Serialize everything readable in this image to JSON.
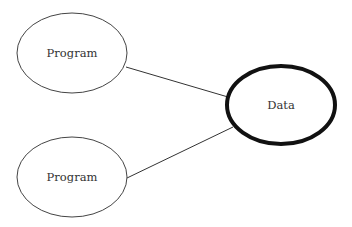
{
  "nodes": [
    {
      "id": "program-1",
      "label": "Program",
      "cx": 72,
      "cy": 53,
      "rx": 55,
      "ry": 40,
      "stroke": "#444444",
      "stroke_width": 1
    },
    {
      "id": "program-2",
      "label": "Program",
      "cx": 72,
      "cy": 177,
      "rx": 55,
      "ry": 40,
      "stroke": "#444444",
      "stroke_width": 1
    },
    {
      "id": "data",
      "label": "Data",
      "cx": 281,
      "cy": 105,
      "rx": 54,
      "ry": 39,
      "stroke": "#111111",
      "stroke_width": 4
    }
  ],
  "edges": [
    {
      "from": "program-1",
      "to": "data",
      "x1": 126,
      "y1": 67,
      "x2": 228,
      "y2": 97
    },
    {
      "from": "program-2",
      "to": "data",
      "x1": 127,
      "y1": 178,
      "x2": 233,
      "y2": 127
    }
  ],
  "colors": {
    "background": "#ffffff",
    "line": "#333333",
    "text": "#333333"
  }
}
